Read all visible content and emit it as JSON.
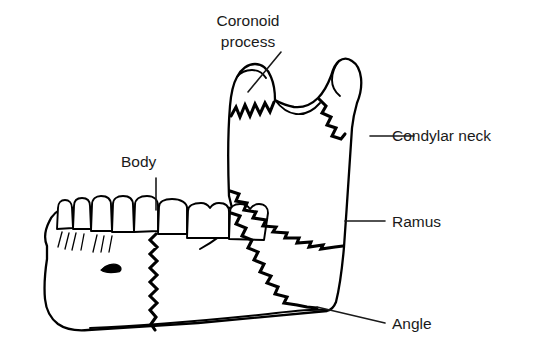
{
  "figure": {
    "background_color": "#ffffff",
    "line_color": "#000000",
    "text_color": "#1a1a1a"
  },
  "labels": {
    "coronoid_process": {
      "line1": "Coronoid",
      "line2": "process",
      "text_x": 248,
      "text_y": 26,
      "text_y2": 47,
      "leader": "M 281 52 L 248 92"
    },
    "condylar_neck": {
      "text": "Condylar neck",
      "text_x": 392,
      "text_y": 141,
      "leader": "M 370 136 L 414 136"
    },
    "ramus": {
      "text": "Ramus",
      "text_x": 392,
      "text_y": 227,
      "leader": "M 345 221 L 385 221"
    },
    "angle": {
      "text": "Angle",
      "text_x": 392,
      "text_y": 329,
      "leader": "M 317 307 L 385 323"
    },
    "body": {
      "text": "Body",
      "text_x": 121,
      "text_y": 167,
      "leader": "M 156 178 L 156 210"
    }
  },
  "anatomy": {
    "parts": [
      "coronoid process",
      "condyle",
      "condylar neck",
      "sigmoid notch",
      "ramus",
      "angle",
      "body",
      "teeth",
      "mental foramen"
    ],
    "tooth_count": 8,
    "fracture_lines": [
      "coronoid base",
      "condylar neck",
      "ramus oblique",
      "angle oblique",
      "body vertical"
    ]
  }
}
